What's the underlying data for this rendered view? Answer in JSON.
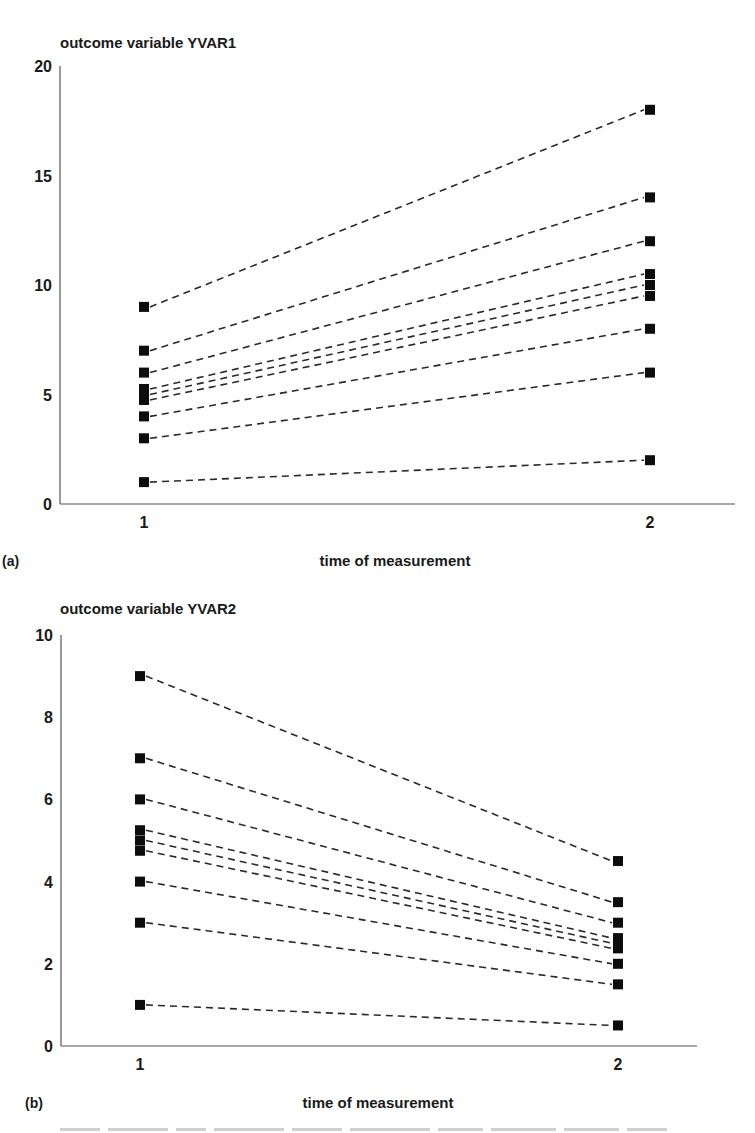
{
  "chart_data": [
    {
      "type": "line",
      "panel": "(a)",
      "title": "outcome variable YVAR1",
      "xlabel": "time of measurement",
      "ylabel": "outcome variable YVAR1",
      "categories": [
        "1",
        "2"
      ],
      "x": [
        1,
        2
      ],
      "ylim": [
        0,
        20
      ],
      "yticks": [
        0,
        5,
        10,
        15,
        20
      ],
      "grid": false,
      "legend": "none",
      "line_style": "dashed",
      "marker": "square",
      "series": [
        {
          "name": "case 1",
          "values": [
            9,
            18
          ]
        },
        {
          "name": "case 2",
          "values": [
            7,
            14
          ]
        },
        {
          "name": "case 3",
          "values": [
            6,
            12
          ]
        },
        {
          "name": "case 4",
          "values": [
            5.25,
            10.5
          ]
        },
        {
          "name": "case 5",
          "values": [
            5,
            10
          ]
        },
        {
          "name": "case 6",
          "values": [
            4.75,
            9.5
          ]
        },
        {
          "name": "case 7",
          "values": [
            4,
            8
          ]
        },
        {
          "name": "case 8",
          "values": [
            3,
            6
          ]
        },
        {
          "name": "case 9",
          "values": [
            1,
            2
          ]
        }
      ]
    },
    {
      "type": "line",
      "panel": "(b)",
      "title": "outcome variable YVAR2",
      "xlabel": "time of measurement",
      "ylabel": "outcome variable YVAR2",
      "categories": [
        "1",
        "2"
      ],
      "x": [
        1,
        2
      ],
      "ylim": [
        0,
        10
      ],
      "yticks": [
        0,
        2,
        4,
        6,
        8,
        10
      ],
      "grid": false,
      "legend": "none",
      "line_style": "dashed",
      "marker": "square",
      "series": [
        {
          "name": "case 1",
          "values": [
            9,
            4.5
          ]
        },
        {
          "name": "case 2",
          "values": [
            7,
            3.5
          ]
        },
        {
          "name": "case 3",
          "values": [
            6,
            3
          ]
        },
        {
          "name": "case 4",
          "values": [
            5.25,
            2.625
          ]
        },
        {
          "name": "case 5",
          "values": [
            5,
            2.5
          ]
        },
        {
          "name": "case 6",
          "values": [
            4.75,
            2.375
          ]
        },
        {
          "name": "case 7",
          "values": [
            4,
            2
          ]
        },
        {
          "name": "case 8",
          "values": [
            3,
            1.5
          ]
        },
        {
          "name": "case 9",
          "values": [
            1,
            0.5
          ]
        }
      ]
    }
  ],
  "panels": {
    "a": {
      "label": "(a)",
      "title": "outcome variable YVAR1",
      "xlabel": "time of measurement",
      "yticks": [
        "0",
        "5",
        "10",
        "15",
        "20"
      ],
      "xticks": [
        "1",
        "2"
      ]
    },
    "b": {
      "label": "(b)",
      "title": "outcome variable YVAR2",
      "xlabel": "time of measurement",
      "yticks": [
        "0",
        "2",
        "4",
        "6",
        "8",
        "10"
      ],
      "xticks": [
        "1",
        "2"
      ]
    }
  },
  "colors": {
    "line": "#2a2a2a",
    "marker": "#0d0d0d",
    "axis": "#555555",
    "text": "#1a1a1a",
    "background": "#ffffff"
  }
}
